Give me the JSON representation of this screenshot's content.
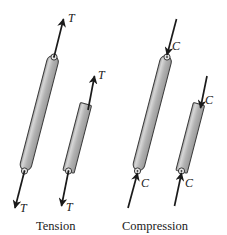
{
  "figure": {
    "background_color": "#ffffff",
    "width": 227,
    "height": 235
  },
  "style": {
    "bar_fill": "#b5b5b5",
    "bar_highlight": "#d8d8d8",
    "bar_stroke": "#3a3a3a",
    "arrow_color": "#1a1a1a",
    "text_color": "#1a1a1a",
    "pin_fill": "#e8e8e8"
  },
  "groups": [
    {
      "id": "tension",
      "caption": "Tension",
      "caption_x": 58,
      "caption_y": 228,
      "force_symbol": "T",
      "direction": "outward",
      "members": [
        {
          "id": "tension-long-bar",
          "length": "long",
          "top_end": "pinned",
          "bottom_end": "pinned",
          "top_label": "T",
          "bottom_label": "T"
        },
        {
          "id": "tension-short-bar",
          "length": "short",
          "top_end": "cut",
          "bottom_end": "pinned",
          "top_label": "T",
          "bottom_label": "T"
        }
      ]
    },
    {
      "id": "compression",
      "caption": "Compression",
      "caption_x": 123,
      "caption_y": 228,
      "force_symbol": "C",
      "direction": "inward",
      "members": [
        {
          "id": "compression-long-bar",
          "length": "long",
          "top_end": "pinned",
          "bottom_end": "pinned",
          "top_label": "C",
          "bottom_label": "C"
        },
        {
          "id": "compression-short-bar",
          "length": "short",
          "top_end": "cut",
          "bottom_end": "pinned",
          "top_label": "C",
          "bottom_label": "C"
        }
      ]
    }
  ],
  "labels": {
    "tension_top_long": "T",
    "tension_top_short": "T",
    "tension_bottom_long": "T",
    "tension_bottom_short": "T",
    "compression_top_long": "C",
    "compression_top_short": "C",
    "compression_bottom_long": "C",
    "compression_bottom_short": "C",
    "caption_tension": "Tension",
    "caption_compression": "Compression"
  }
}
